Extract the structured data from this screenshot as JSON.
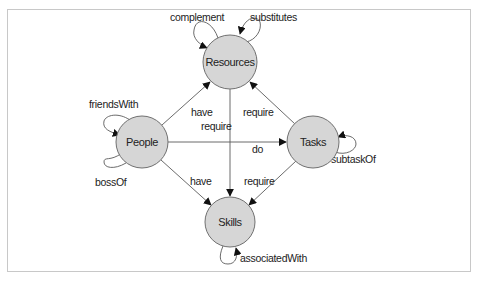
{
  "diagram": {
    "nodes": [
      {
        "id": "resources",
        "label": "Resources",
        "cx": 230,
        "cy": 62,
        "r": 27
      },
      {
        "id": "people",
        "label": "People",
        "cx": 142,
        "cy": 142,
        "r": 26
      },
      {
        "id": "tasks",
        "label": "Tasks",
        "cx": 313,
        "cy": 142,
        "r": 26
      },
      {
        "id": "skills",
        "label": "Skills",
        "cx": 230,
        "cy": 222,
        "r": 25
      }
    ],
    "edges": [
      {
        "from": "people",
        "to": "resources",
        "label": "have"
      },
      {
        "from": "tasks",
        "to": "resources",
        "label": "require"
      },
      {
        "from": "resources",
        "to": "skills",
        "label": "require"
      },
      {
        "from": "people",
        "to": "tasks",
        "label": "do"
      },
      {
        "from": "people",
        "to": "skills",
        "label": "have"
      },
      {
        "from": "tasks",
        "to": "skills",
        "label": "require"
      }
    ],
    "self_loops": [
      {
        "node": "resources",
        "label": "complement"
      },
      {
        "node": "resources",
        "label": "substitutes"
      },
      {
        "node": "people",
        "label": "friendsWith"
      },
      {
        "node": "people",
        "label": "bossOf"
      },
      {
        "node": "tasks",
        "label": "subtaskOf"
      },
      {
        "node": "skills",
        "label": "associatedWith"
      }
    ]
  }
}
